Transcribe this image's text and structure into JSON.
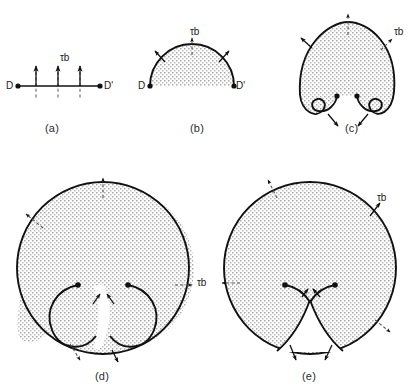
{
  "figure": {
    "caption_labels": [
      {
        "id": "a",
        "text": "(a)",
        "x": 45,
        "y": 122
      },
      {
        "id": "b",
        "text": "(b)",
        "x": 190,
        "y": 122
      },
      {
        "id": "c",
        "text": "(c)",
        "x": 345,
        "y": 122
      },
      {
        "id": "d",
        "text": "(d)",
        "x": 95,
        "y": 370
      },
      {
        "id": "e",
        "text": "(e)",
        "x": 302,
        "y": 370
      }
    ],
    "stress_symbol": {
      "tau": "τ",
      "burgers": "b",
      "combined": "τb"
    },
    "stress_labels": [
      {
        "panel": "a",
        "x": 60,
        "y": 52
      },
      {
        "panel": "b",
        "x": 190,
        "y": 26
      },
      {
        "panel": "c",
        "x": 394,
        "y": 26
      },
      {
        "panel": "d",
        "x": 197,
        "y": 277
      },
      {
        "panel": "e",
        "x": 377,
        "y": 192
      }
    ],
    "endpoint_labels": [
      {
        "panel": "a",
        "text": "D",
        "x": 6,
        "y": 82
      },
      {
        "panel": "a",
        "text": "D'",
        "x": 104,
        "y": 82
      },
      {
        "panel": "b",
        "text": "D",
        "x": 140,
        "y": 88
      },
      {
        "panel": "b",
        "text": "D'",
        "x": 233,
        "y": 88
      }
    ],
    "colors": {
      "line": "#111111",
      "stipple": "#9a9a9a",
      "background": "#ffffff",
      "dash": "#555555",
      "text": "#1a1a1a"
    },
    "panels": [
      {
        "id": "a",
        "name": "straight-dislocation-segment",
        "description": "Straight dislocation line pinned between nodes D and D' with three applied force arrows"
      },
      {
        "id": "b",
        "name": "bowed-dislocation-arc",
        "description": "Dislocation bowed into a semicircular arc between D and D'"
      },
      {
        "id": "c",
        "name": "expanded-loop-with-curled-ends",
        "description": "Loop expanded beyond semicircle with two inward curling ends"
      },
      {
        "id": "d",
        "name": "loop-arms-approaching",
        "description": "Near circular loop whose two spiral arms approach each other below the pinning points"
      },
      {
        "id": "e",
        "name": "loop-arms-annihilating",
        "description": "Arms meet and annihilate leaving a closed loop and a regenerated segment"
      }
    ]
  }
}
